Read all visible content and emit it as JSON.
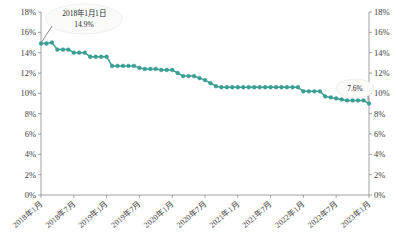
{
  "chart_data": {
    "type": "line",
    "title": "",
    "xlabel": "",
    "ylabel": "",
    "ylim": [
      0,
      18
    ],
    "ytick_values": [
      0,
      2,
      4,
      6,
      8,
      10,
      12,
      14,
      16,
      18
    ],
    "ytick_labels": [
      "0%",
      "2%",
      "4%",
      "6%",
      "8%",
      "10%",
      "12%",
      "14%",
      "16%",
      "18%"
    ],
    "y_axis_both_sides": true,
    "grid": false,
    "legend": "none",
    "series_color": "#3a9e93",
    "marker": "circle",
    "xtick_labels": [
      "2018年1月",
      "2018年7月",
      "2019年1月",
      "2019年7月",
      "2020年1月",
      "2020年7月",
      "2021年1月",
      "2021年7月",
      "2022年1月",
      "2022年7月",
      "2023年1月"
    ],
    "x": [
      "2018-01",
      "2018-02",
      "2018-03",
      "2018-04",
      "2018-05",
      "2018-06",
      "2018-07",
      "2018-08",
      "2018-09",
      "2018-10",
      "2018-11",
      "2018-12",
      "2019-01",
      "2019-02",
      "2019-03",
      "2019-04",
      "2019-05",
      "2019-06",
      "2019-07",
      "2019-08",
      "2019-09",
      "2019-10",
      "2019-11",
      "2019-12",
      "2020-01",
      "2020-02",
      "2020-03",
      "2020-04",
      "2020-05",
      "2020-06",
      "2020-07",
      "2020-08",
      "2020-09",
      "2020-10",
      "2020-11",
      "2020-12",
      "2021-01",
      "2021-02",
      "2021-03",
      "2021-04",
      "2021-05",
      "2021-06",
      "2021-07",
      "2021-08",
      "2021-09",
      "2021-10",
      "2021-11",
      "2021-12",
      "2022-01",
      "2022-02",
      "2022-03",
      "2022-04",
      "2022-05",
      "2022-06",
      "2022-07",
      "2022-08",
      "2022-09",
      "2022-10",
      "2022-11",
      "2022-12",
      "2023-01"
    ],
    "values": [
      14.9,
      14.9,
      15.0,
      14.3,
      14.3,
      14.3,
      14.0,
      14.0,
      14.0,
      13.6,
      13.6,
      13.6,
      13.6,
      12.7,
      12.7,
      12.7,
      12.7,
      12.7,
      12.5,
      12.4,
      12.4,
      12.4,
      12.3,
      12.3,
      12.3,
      12.0,
      11.7,
      11.7,
      11.7,
      11.5,
      11.3,
      11.0,
      10.7,
      10.6,
      10.6,
      10.6,
      10.6,
      10.6,
      10.6,
      10.6,
      10.6,
      10.6,
      10.6,
      10.6,
      10.6,
      10.6,
      10.6,
      10.6,
      10.2,
      10.2,
      10.2,
      10.2,
      9.7,
      9.6,
      9.5,
      9.4,
      9.3,
      9.3,
      9.3,
      9.3,
      9.0
    ],
    "values_note": "monthly observations 2018-01 through 2023-01",
    "annotations": [
      {
        "name": "start-annotation",
        "line1": "2018年1月1日",
        "line2": "14.9%",
        "target_index": 0,
        "target_value": 14.9
      },
      {
        "name": "end-annotation",
        "line1": "7.6%",
        "line2": "",
        "target_index": 60,
        "target_value": 7.6
      }
    ]
  }
}
